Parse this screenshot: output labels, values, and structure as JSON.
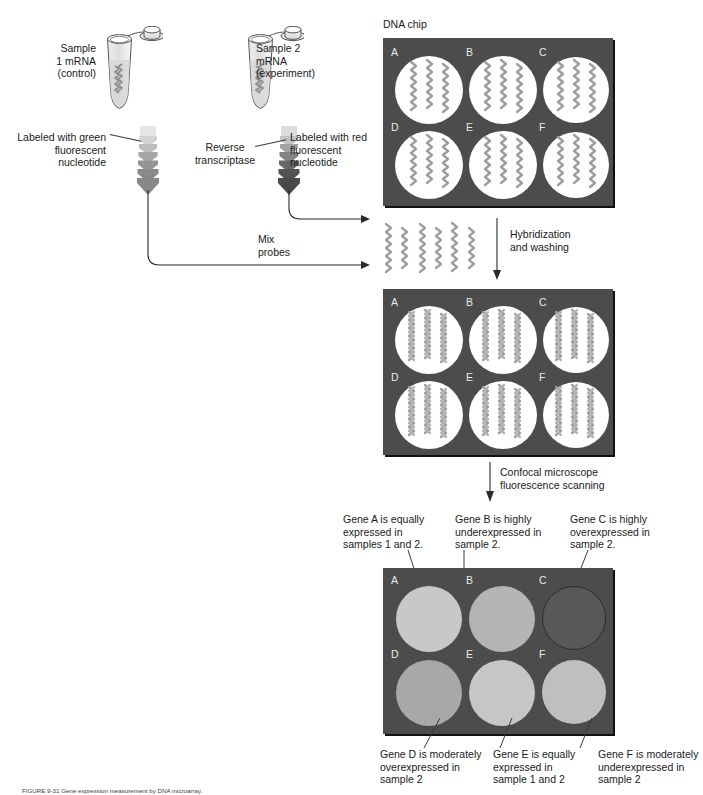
{
  "figure": {
    "title_note": "DNA microarray (DNA chip) expression experiment workflow",
    "caption": "FIGURE 9-31  Gene expression measurement by DNA microarray."
  },
  "samples": [
    {
      "id": "sample1",
      "label": "Sample\n1 mRNA\n(control)",
      "tube_name": "sample-1-tube"
    },
    {
      "id": "sample2",
      "label": "Sample 2\nmRNA\n(experiment)",
      "tube_name": "sample-2-tube"
    }
  ],
  "labeling": {
    "green": "Labeled with green\nfluorescent\nnucleotide",
    "red": "Labeled with red\nfluorescent\nnucleotide",
    "enzyme": "Reverse\ntranscriptase",
    "mix": "Mix\nprobes"
  },
  "steps": {
    "hybridization": "Hybridization\nand washing",
    "scanning": "Confocal microscope\nfluorescence scanning"
  },
  "chip": {
    "title": "DNA chip",
    "wells": [
      "A",
      "B",
      "C",
      "D",
      "E",
      "F"
    ]
  },
  "results": {
    "top_annotations": [
      {
        "well": "A",
        "text": "Gene A is equally\nexpressed in\nsamples 1 and 2."
      },
      {
        "well": "B",
        "text": "Gene B is highly\nunderexpressed in\nsample 2."
      },
      {
        "well": "C",
        "text": "Gene C is highly\noverexpressed in\nsample 2."
      }
    ],
    "bottom_annotations": [
      {
        "well": "D",
        "text": "Gene D is moderately\noverexpressed in\nsample 2"
      },
      {
        "well": "E",
        "text": "Gene E is equally\nexpressed in\nsample 1 and 2"
      },
      {
        "well": "F",
        "text": "Gene F is moderately\nunderexpressed in\nsample 2"
      }
    ],
    "spot_intensities": [
      {
        "well": "A",
        "color": "#c8c8c8",
        "meaning": "equal expression"
      },
      {
        "well": "B",
        "color": "#b4b4b4",
        "meaning": "highly underexpressed"
      },
      {
        "well": "C",
        "color": "#585858",
        "meaning": "highly overexpressed"
      },
      {
        "well": "D",
        "color": "#a8a8a8",
        "meaning": "moderately overexpressed"
      },
      {
        "well": "E",
        "color": "#c6c6c6",
        "meaning": "equally expressed"
      },
      {
        "well": "F",
        "color": "#bfbfbf",
        "meaning": "moderately underexpressed"
      }
    ]
  },
  "colors": {
    "chip_background": "#4c4c4c",
    "well_white": "#ffffff",
    "dna_gray": "#9a9a9a",
    "arrow_light": "#dcdcdc",
    "arrow_dark": "#6e6e6e",
    "arrow_dark2": "#3f3f3f",
    "line": "#2a2a2a"
  }
}
